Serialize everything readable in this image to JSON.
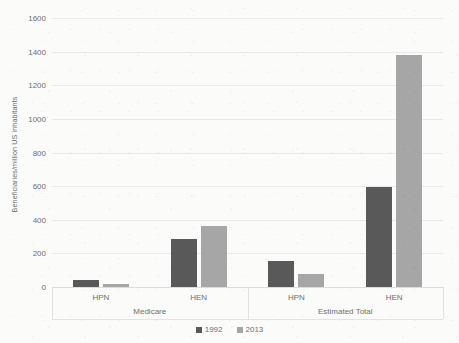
{
  "chart_data": {
    "type": "bar",
    "title": "",
    "subtitle": "",
    "xlabel": "",
    "ylabel": "Beneficiaries/million US inhabitants",
    "ylim": [
      0,
      1600
    ],
    "yticks": [
      0,
      200,
      400,
      600,
      800,
      1000,
      1200,
      1400,
      1600
    ],
    "ytick_labels": [
      "0",
      "200",
      "400",
      "600",
      "800",
      "1000",
      "1200",
      "1400",
      "1600"
    ],
    "grid": "horizontal",
    "legend_position": "bottom-center",
    "group_labels": [
      "Medicare",
      "Estimated Total"
    ],
    "categories": [
      "HPN",
      "HEN",
      "HPN",
      "HEN"
    ],
    "groups": [
      {
        "label": "Medicare",
        "categories": [
          "HPN",
          "HEN"
        ]
      },
      {
        "label": "Estimated Total",
        "categories": [
          "HPN",
          "HEN"
        ]
      }
    ],
    "series": [
      {
        "name": "1992",
        "color": "#595959",
        "values": [
          40,
          285,
          155,
          595
        ]
      },
      {
        "name": "2013",
        "color": "#a6a6a6",
        "values": [
          20,
          360,
          80,
          1380
        ]
      }
    ],
    "legend": [
      "1992",
      "2013"
    ],
    "colors": {
      "series_1992": "#595959",
      "series_2013": "#a6a6a6",
      "gridline": "#e8e8e8",
      "axis_text": "#6f6f6f",
      "background": "#fbfbfa"
    }
  }
}
